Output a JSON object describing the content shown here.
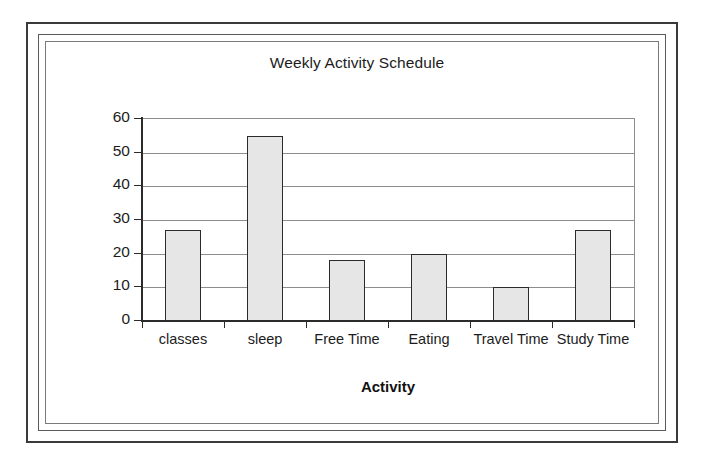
{
  "chart_data": {
    "type": "bar",
    "title": "Weekly Activity Schedule",
    "xlabel": "Activity",
    "ylabel": "",
    "categories": [
      "classes",
      "sleep",
      "Free Time",
      "Eating",
      "Travel Time",
      "Study Time"
    ],
    "values": [
      27,
      55,
      18,
      20,
      10,
      27
    ],
    "ylim": [
      0,
      60
    ],
    "ytick_labels": [
      "60",
      "50",
      "40",
      "30",
      "20",
      "10",
      "0"
    ],
    "ytick_values": [
      60,
      50,
      40,
      30,
      20,
      10,
      0
    ],
    "ystep": 10,
    "grid": true,
    "legend": false,
    "legend_position": "none",
    "bar_fill_color": "#e6e6e6",
    "bar_border_color": "#2b2b2b",
    "plot_background": "#ffffff",
    "gridline_color": "#8d8d8d",
    "axis_color": "#2b2b2b",
    "text_color": "#1c1c1c",
    "series": [
      {
        "name": "Hours",
        "values": [
          27,
          55,
          18,
          20,
          10,
          27
        ]
      }
    ],
    "points": [
      {
        "category": "classes",
        "value": 27
      },
      {
        "category": "sleep",
        "value": 55
      },
      {
        "category": "Free Time",
        "value": 18
      },
      {
        "category": "Eating",
        "value": 20
      },
      {
        "category": "Travel Time",
        "value": 10
      },
      {
        "category": "Study Time",
        "value": 27
      }
    ]
  },
  "frame": {
    "border_outer_color": "#3a3a3a",
    "border_middle_color": "#5a5a5a",
    "border_inner_color": "#7a7a7a"
  }
}
